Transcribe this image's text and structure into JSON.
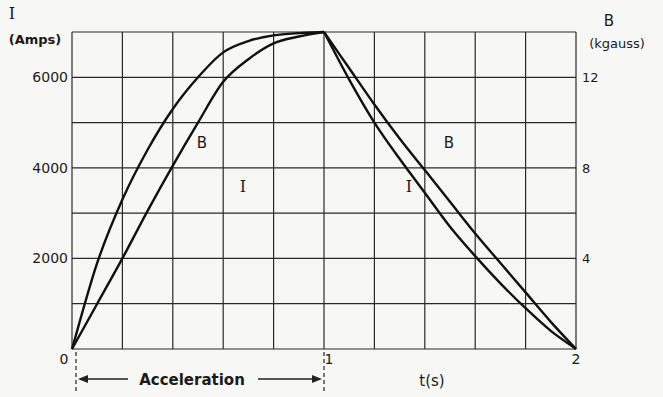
{
  "chart_data": {
    "type": "line",
    "title": "",
    "xlabel": "t(s)",
    "ylabel_left": "I (Amps)",
    "ylabel_left_symbol": "I",
    "ylabel_left_unit": "(Amps)",
    "ylabel_right_symbol": "B",
    "ylabel_right_unit": "(kgauss)",
    "xlim": [
      0,
      2
    ],
    "ylim_left": [
      0,
      7000
    ],
    "ylim_right": [
      0,
      14
    ],
    "x_ticks": [
      "0",
      "1",
      "2"
    ],
    "y_left_ticks": [
      "2000",
      "4000",
      "6000"
    ],
    "y_right_ticks": [
      "4",
      "8",
      "12"
    ],
    "grid": true,
    "grid_columns": 10,
    "grid_rows": 7,
    "annotation": "Acceleration",
    "annotation_range": [
      0,
      1
    ],
    "x": [
      0,
      0.1,
      0.2,
      0.3,
      0.4,
      0.5,
      0.6,
      0.7,
      0.8,
      0.9,
      1.0,
      1.1,
      1.2,
      1.3,
      1.4,
      1.5,
      1.6,
      1.7,
      1.8,
      1.9,
      2.0
    ],
    "series": [
      {
        "name": "B",
        "axis": "right",
        "label": "B",
        "values": [
          0,
          3.8,
          6.6,
          8.8,
          10.6,
          12.0,
          13.1,
          13.6,
          13.85,
          13.95,
          14.0,
          12.4,
          10.8,
          9.3,
          7.9,
          6.5,
          5.1,
          3.8,
          2.5,
          1.2,
          0
        ]
      },
      {
        "name": "I",
        "axis": "left",
        "label": "I",
        "values": [
          0,
          1000,
          2000,
          3050,
          4050,
          5000,
          5900,
          6400,
          6750,
          6900,
          7000,
          5950,
          5000,
          4200,
          3450,
          2700,
          2050,
          1450,
          900,
          400,
          0
        ]
      }
    ]
  },
  "labels": {
    "left_symbol": "I",
    "left_unit": "(Amps)",
    "right_symbol": "B",
    "right_unit": "(kgauss)",
    "x_axis": "t(s)",
    "acceleration": "Acceleration",
    "curve_b_left": "B",
    "curve_i_left": "I",
    "curve_b_right": "B",
    "curve_i_right": "I"
  }
}
